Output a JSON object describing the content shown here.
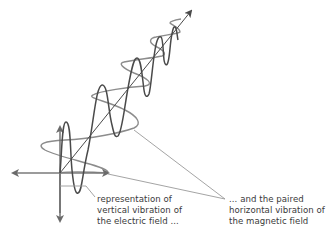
{
  "diagram": {
    "colors": {
      "electric_wave": "#4a4a4a",
      "magnetic_wave": "#8c8c8c",
      "axes": "#6a6a6a",
      "propagation_axis": "#4a4a4a",
      "leader_lines": "#9a9a9a",
      "text": "#3a3a3a"
    },
    "labels": {
      "electric": {
        "lines": [
          "representation of",
          "vertical vibration of",
          "the electric field ..."
        ]
      },
      "magnetic": {
        "lines": [
          "... and the paired",
          "horizontal vibration of",
          "the magnetic field"
        ]
      }
    },
    "elements": {
      "vertical_axis": "vertical-axis-arrow",
      "horizontal_axis": "horizontal-axis-arrow",
      "propagation_axis": "propagation-direction-arrow",
      "electric_wave": "vertical-sine-wave",
      "magnetic_wave": "horizontal-sine-wave"
    }
  }
}
